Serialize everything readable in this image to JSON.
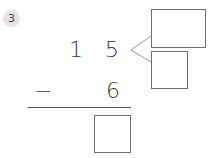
{
  "problem": {
    "number": "3",
    "tens_digit": "1",
    "ones_digit": "5",
    "operator": "−",
    "subtrahend": "6",
    "answer_box": "",
    "decompose_box_top": "",
    "decompose_box_bottom": ""
  },
  "colors": {
    "badge_bg": "#e4e4e4",
    "line": "#6e6e6e",
    "text": "#3a3a3a"
  }
}
